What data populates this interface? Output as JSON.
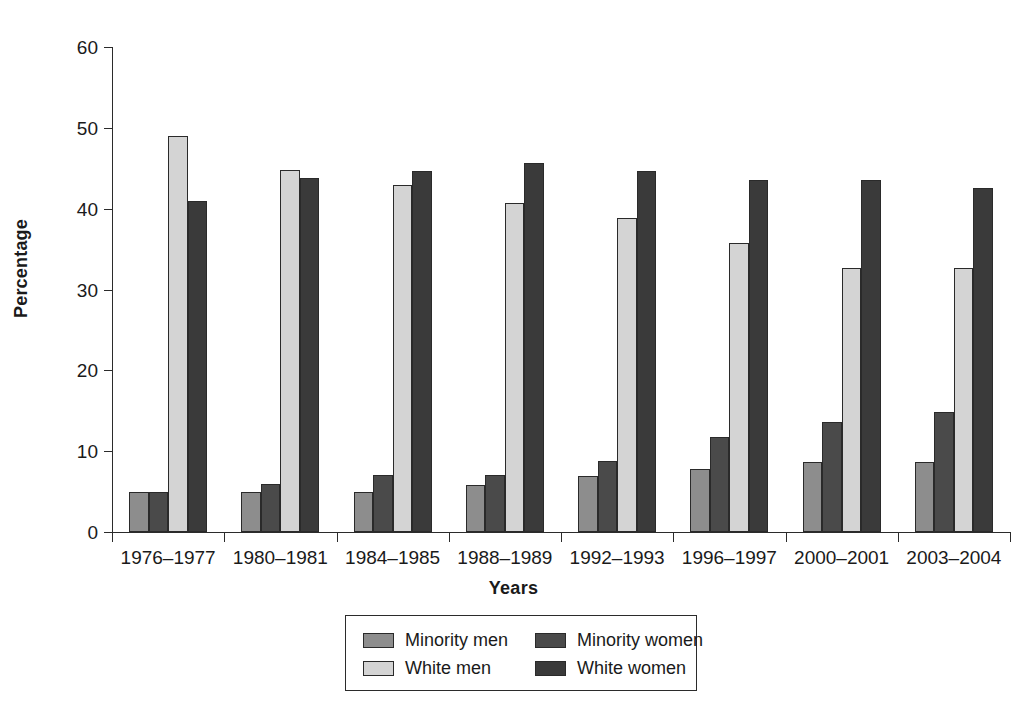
{
  "chart_data": {
    "type": "bar",
    "title": "",
    "xlabel": "Years",
    "ylabel": "Percentage",
    "ylim": [
      0,
      60
    ],
    "yticks": [
      0,
      10,
      20,
      30,
      40,
      50,
      60
    ],
    "grid": false,
    "legend_position": "bottom",
    "categories": [
      "1976–1977",
      "1980–1981",
      "1984–1985",
      "1988–1989",
      "1992–1993",
      "1996–1997",
      "2000–2001",
      "2003–2004"
    ],
    "series": [
      {
        "name": "Minority men",
        "color": "#8d8d8d",
        "values": [
          5.0,
          5.0,
          4.9,
          5.8,
          6.9,
          7.8,
          8.6,
          8.6
        ]
      },
      {
        "name": "Minority women",
        "color": "#4a4a4a",
        "values": [
          5.0,
          6.0,
          7.0,
          7.0,
          8.8,
          11.8,
          13.6,
          14.8
        ]
      },
      {
        "name": "White men",
        "color": "#d4d4d4",
        "values": [
          49.0,
          44.8,
          42.9,
          40.7,
          38.9,
          35.8,
          32.7,
          32.6
        ]
      },
      {
        "name": "White women",
        "color": "#3a3a3a",
        "values": [
          40.9,
          43.8,
          44.7,
          45.7,
          44.6,
          43.6,
          43.6,
          42.6
        ]
      }
    ]
  },
  "legend": {
    "entries": [
      {
        "label": "Minority men"
      },
      {
        "label": "Minority women"
      },
      {
        "label": "White men"
      },
      {
        "label": "White women"
      }
    ]
  }
}
